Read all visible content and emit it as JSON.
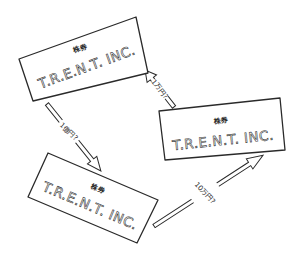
{
  "diagram": {
    "colors": {
      "background": "#ffffff",
      "ink": "#2a2a2a"
    },
    "certificates": [
      {
        "id": "certificate-top-left",
        "label": "株券",
        "company": "T.R.E.N.T. INC.",
        "corners": [
          [
            19,
            59
          ],
          [
            136,
            17
          ],
          [
            148,
            73
          ],
          [
            33,
            101
          ]
        ]
      },
      {
        "id": "certificate-right",
        "label": "株券",
        "company": "T.R.E.N.T. INC.",
        "corners": [
          [
            159,
            111
          ],
          [
            280,
            98
          ],
          [
            285,
            150
          ],
          [
            165,
            160
          ]
        ]
      },
      {
        "id": "certificate-bottom-left",
        "label": "株券",
        "company": "T.R.E.N.T. INC.",
        "corners": [
          [
            48,
            153
          ],
          [
            158,
            200
          ],
          [
            137,
            243
          ],
          [
            28,
            197
          ]
        ]
      }
    ],
    "arrows": [
      {
        "id": "arrow-top-left-to-bottom-left",
        "from": "certificate-top-left",
        "to": "certificate-bottom-left",
        "label": "1億円?"
      },
      {
        "id": "arrow-bottom-left-to-right",
        "from": "certificate-bottom-left",
        "to": "certificate-right",
        "label": "10万円?"
      },
      {
        "id": "arrow-right-to-top-left",
        "from": "certificate-right",
        "to": "certificate-top-left",
        "label": "1万円?"
      }
    ]
  }
}
